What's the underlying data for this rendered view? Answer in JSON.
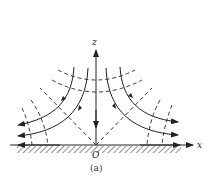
{
  "figure": {
    "type": "flow-field",
    "axis_labels": {
      "x": "x",
      "z": "z",
      "origin": "O"
    },
    "caption": "(a)",
    "colors": {
      "line": "#222222",
      "background": "#ffffff",
      "hatch": "#444444"
    }
  }
}
